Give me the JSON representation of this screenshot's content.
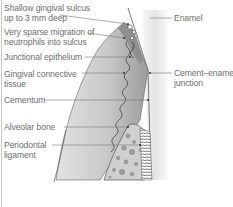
{
  "diagram": {
    "left_labels": [
      {
        "id": "sulcus",
        "lines": [
          "Shallow gingival sulcus",
          "up to 3 mm deep"
        ]
      },
      {
        "id": "neutrophils",
        "lines": [
          "Very sparse migration of",
          "neutrophils into sulcus"
        ]
      },
      {
        "id": "junctional",
        "lines": [
          "Junctional epithelium"
        ]
      },
      {
        "id": "connective",
        "lines": [
          "Gingival connective",
          "tissue"
        ]
      },
      {
        "id": "cementum",
        "lines": [
          "Cementum"
        ]
      },
      {
        "id": "alveolar",
        "lines": [
          "Alveolar bone"
        ]
      },
      {
        "id": "pdl",
        "lines": [
          "Periodontal",
          "ligament"
        ]
      }
    ],
    "right_labels": [
      {
        "id": "enamel",
        "lines": [
          "Enamel"
        ]
      },
      {
        "id": "cej",
        "lines": [
          "Cement–enamel",
          "junction"
        ]
      }
    ],
    "colors": {
      "gingiva": "#a9a9a9",
      "gingiva_light": "#d6d6d6",
      "tooth": "#e6e6e6",
      "outline": "#555555",
      "text": "#6e6e6e",
      "leader": "#777777"
    }
  }
}
